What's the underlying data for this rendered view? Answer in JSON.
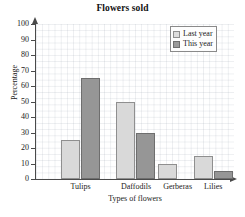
{
  "chart_data": {
    "type": "bar",
    "title": "Flowers sold",
    "xlabel": "Types of flowers",
    "ylabel": "Percentage",
    "categories": [
      "Tulips",
      "Daffodils",
      "Gerberas",
      "Lilies"
    ],
    "series": [
      {
        "name": "Last year",
        "color": "#d9d9d9",
        "values": [
          25,
          50,
          10,
          15
        ]
      },
      {
        "name": "This year",
        "color": "#969696",
        "values": [
          65,
          30,
          0,
          5
        ]
      }
    ],
    "ylim": [
      0,
      100
    ],
    "ytick_step": 10,
    "ytick_labels": [
      "100",
      "90",
      "80",
      "70",
      "60",
      "50",
      "40",
      "30",
      "20",
      "10",
      "0"
    ],
    "grid": true,
    "legend_position": "top-right"
  },
  "legend": {
    "entries": [
      {
        "label": "Last year",
        "swatch": "light-gray-square"
      },
      {
        "label": "This year",
        "swatch": "dark-gray-square"
      }
    ]
  }
}
